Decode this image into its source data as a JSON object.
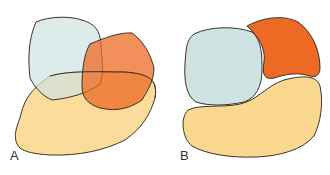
{
  "panels": [
    {
      "label": "A",
      "description": "Overlapping shapes"
    },
    {
      "label": "B",
      "description": "Separated shapes"
    }
  ],
  "colors": {
    "blue": "#cfe3e3",
    "orange": "#ee6a24",
    "yellow": "#fbd890",
    "stroke": "#3a3226"
  }
}
